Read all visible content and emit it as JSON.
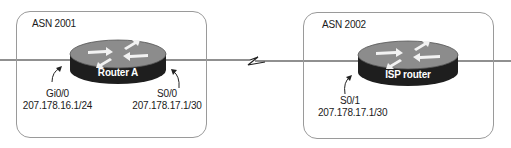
{
  "colors": {
    "router_top": "#8c8c8c",
    "router_side": "#1e1e1e",
    "arrow": "#f2f2f2",
    "link": "#222222",
    "box_border": "#9a9a9a"
  },
  "domains": [
    {
      "label": "ASN 2001",
      "router": {
        "name": "Router A",
        "icon": "router-icon"
      },
      "interfaces": [
        {
          "name": "Gi0/0",
          "address": "207.178.16.1/24"
        },
        {
          "name": "S0/0",
          "address": "207.178.17.1/30"
        }
      ]
    },
    {
      "label": "ASN 2002",
      "router": {
        "name": "ISP router",
        "icon": "router-icon"
      },
      "interfaces": [
        {
          "name": "S0/1",
          "address": "207.178.17.1/30"
        }
      ]
    }
  ],
  "links": [
    {
      "type": "ethernet",
      "from": "left-edge",
      "to": "Router A"
    },
    {
      "type": "serial",
      "icon": "lightning-bolt-icon",
      "from": "Router A",
      "to": "ISP router"
    },
    {
      "type": "ethernet",
      "from": "ISP router",
      "to": "right-edge"
    }
  ]
}
